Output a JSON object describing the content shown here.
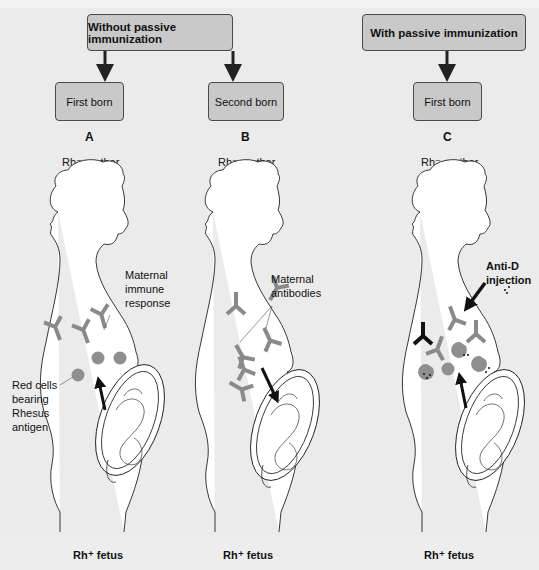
{
  "headers": {
    "without": "Without passive immunization",
    "with": "With passive immunization"
  },
  "panels": [
    {
      "letter": "A",
      "box_label": "First born",
      "mother_label": "Rh⁻ mother",
      "fetus_label": "Rh⁺ fetus",
      "callouts": [
        "Maternal immune response",
        "Red cells bearing Rhesus antigen"
      ]
    },
    {
      "letter": "B",
      "box_label": "Second born",
      "mother_label": "Rh⁻ mother",
      "fetus_label": "Rh⁺ fetus",
      "callouts": [
        "Maternal antibodies"
      ]
    },
    {
      "letter": "C",
      "box_label": "First born",
      "mother_label": "Rh⁻ mother",
      "fetus_label": "Rh⁺ fetus",
      "callouts": [
        "Anti-D injection"
      ]
    }
  ],
  "callout_lines": {
    "a_immune": [
      "Maternal",
      "immune",
      "response"
    ],
    "a_redcells": [
      "Red cells",
      "bearing",
      "Rhesus",
      "antigen"
    ],
    "b_antibodies": [
      "Maternal",
      "antibodies"
    ],
    "c_injection": [
      "Anti-D",
      "injection"
    ]
  },
  "colors": {
    "background": "#ebebeb",
    "box_fill": "#c9c9c9",
    "antibody_gray": "#8a8a8a",
    "red_cell_gray": "#8f8f8f",
    "anti_d_black": "#111111"
  }
}
